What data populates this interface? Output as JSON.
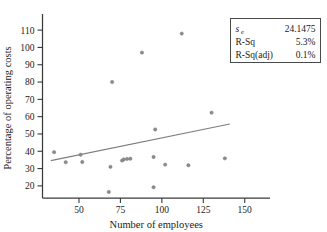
{
  "chart_data": {
    "type": "scatter",
    "title": "",
    "xlabel": "Number of employees",
    "ylabel": "Percentage of operating costs",
    "xlim": [
      28,
      158
    ],
    "ylim": [
      13,
      117
    ],
    "xticks": [
      50,
      75,
      100,
      125,
      150
    ],
    "yticks": [
      20,
      30,
      40,
      50,
      60,
      70,
      80,
      90,
      100,
      110
    ],
    "grid": false,
    "legend_position": "top-right",
    "marker_color": "#8c8c8c",
    "line_color": "#7e7e7e",
    "axis_color": "#3a3a3a",
    "points": [
      {
        "x": 35,
        "y": 39.5
      },
      {
        "x": 42,
        "y": 33.7
      },
      {
        "x": 51,
        "y": 38.0
      },
      {
        "x": 52,
        "y": 33.8
      },
      {
        "x": 68,
        "y": 16.5
      },
      {
        "x": 69,
        "y": 31.0
      },
      {
        "x": 70,
        "y": 80.0
      },
      {
        "x": 76,
        "y": 34.6
      },
      {
        "x": 77,
        "y": 35.3
      },
      {
        "x": 79,
        "y": 35.6
      },
      {
        "x": 81,
        "y": 35.7
      },
      {
        "x": 88,
        "y": 97.0
      },
      {
        "x": 95,
        "y": 19.2
      },
      {
        "x": 95,
        "y": 36.7
      },
      {
        "x": 96,
        "y": 52.6
      },
      {
        "x": 102,
        "y": 32.3
      },
      {
        "x": 112,
        "y": 108.0
      },
      {
        "x": 116,
        "y": 31.9
      },
      {
        "x": 130,
        "y": 62.3
      },
      {
        "x": 138,
        "y": 35.9
      }
    ],
    "fit_line": {
      "x_start": 33,
      "y_start": 34.6,
      "x_end": 141,
      "y_end": 55.8
    }
  },
  "legend": {
    "rows": [
      {
        "label": "s",
        "sub": "e",
        "value": "24.1475"
      },
      {
        "label": "R-Sq",
        "sub": "",
        "value": "5.3%"
      },
      {
        "label": "R-Sq(adj)",
        "sub": "",
        "value": "0.1%"
      }
    ]
  }
}
